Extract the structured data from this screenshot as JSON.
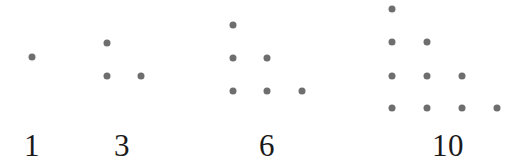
{
  "figure": {
    "background_color": "#ffffff",
    "dot_color": "#6e6e6e",
    "label_color": "#1a1a1a",
    "dot_diameter_px": 7,
    "row_spacing_px": 33,
    "column_spacing_px": 34.5,
    "label_baseline_y_px": 130
  },
  "chart_data": {
    "type": "scatter",
    "xlabel": "",
    "ylabel": "",
    "grid": false,
    "legend": null,
    "categories": [
      "1",
      "3",
      "6",
      "10"
    ],
    "values": [
      1,
      3,
      6,
      10
    ],
    "series": [
      {
        "name": "1",
        "label": "1",
        "rows": 1,
        "dot_count": 1,
        "row_counts": [
          1
        ],
        "label_x": 32,
        "label_y": 130,
        "origin_x": 32,
        "origin_y": 57,
        "points": [
          {
            "x": 32,
            "y": 57
          }
        ]
      },
      {
        "name": "3",
        "label": "3",
        "rows": 2,
        "dot_count": 3,
        "row_counts": [
          1,
          2
        ],
        "label_x": 122,
        "label_y": 130,
        "origin_x": 107,
        "origin_y": 43,
        "points": [
          {
            "x": 107,
            "y": 43
          },
          {
            "x": 107,
            "y": 76
          },
          {
            "x": 141,
            "y": 76
          }
        ]
      },
      {
        "name": "6",
        "label": "6",
        "rows": 3,
        "dot_count": 6,
        "row_counts": [
          1,
          2,
          3
        ],
        "label_x": 267,
        "label_y": 130,
        "origin_x": 233,
        "origin_y": 25,
        "points": [
          {
            "x": 233,
            "y": 25
          },
          {
            "x": 233,
            "y": 58
          },
          {
            "x": 267,
            "y": 58
          },
          {
            "x": 233,
            "y": 91
          },
          {
            "x": 267,
            "y": 91
          },
          {
            "x": 302,
            "y": 91
          }
        ]
      },
      {
        "name": "10",
        "label": "10",
        "rows": 4,
        "dot_count": 10,
        "row_counts": [
          1,
          2,
          3,
          4
        ],
        "label_x": 448,
        "label_y": 130,
        "origin_x": 392,
        "origin_y": 9,
        "points": [
          {
            "x": 392,
            "y": 9
          },
          {
            "x": 392,
            "y": 42
          },
          {
            "x": 427,
            "y": 42
          },
          {
            "x": 392,
            "y": 76
          },
          {
            "x": 427,
            "y": 76
          },
          {
            "x": 462,
            "y": 76
          },
          {
            "x": 392,
            "y": 108
          },
          {
            "x": 427,
            "y": 108
          },
          {
            "x": 462,
            "y": 108
          },
          {
            "x": 497,
            "y": 108
          }
        ]
      }
    ]
  }
}
